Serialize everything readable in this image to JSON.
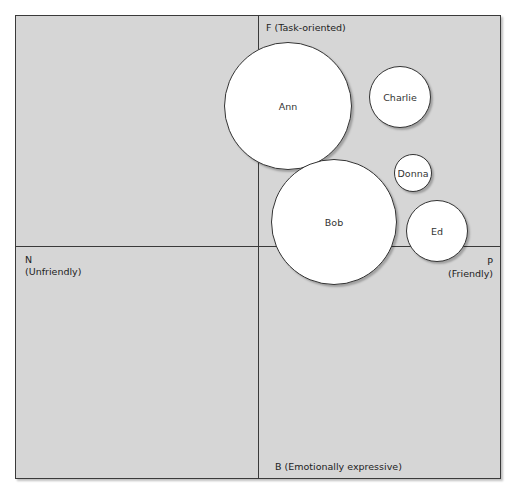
{
  "diagram": {
    "type": "bubble-quadrant",
    "axes": {
      "top": "F (Task-oriented)",
      "bottom": "B (Emotionally expressive)",
      "left_line1": "N",
      "left_line2": "(Unfriendly)",
      "right_line1": "P",
      "right_line2": "(Friendly)"
    },
    "bubbles": [
      {
        "name": "Ann",
        "cx": 288,
        "cy": 106,
        "r": 64
      },
      {
        "name": "Charlie",
        "cx": 400,
        "cy": 97,
        "r": 31
      },
      {
        "name": "Donna",
        "cx": 413,
        "cy": 173,
        "r": 19
      },
      {
        "name": "Bob",
        "cx": 334,
        "cy": 222,
        "r": 63
      },
      {
        "name": "Ed",
        "cx": 437,
        "cy": 231,
        "r": 31
      }
    ],
    "colors": {
      "background": "#d6d6d6",
      "bubble": "#ffffff",
      "lines": "#3a3a3a"
    }
  }
}
